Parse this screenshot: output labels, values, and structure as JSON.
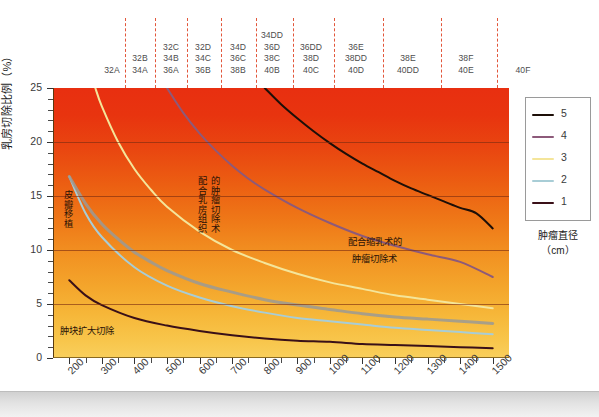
{
  "chart_data": {
    "type": "line",
    "title": "",
    "xlabel": "乳房体积(cm3)",
    "ylabel": "乳房切除比例(%)",
    "xlim": [
      150,
      1550
    ],
    "ylim": [
      0,
      25
    ],
    "xticks": [
      200,
      300,
      400,
      500,
      600,
      700,
      800,
      900,
      1000,
      1100,
      1200,
      1300,
      1400,
      1500
    ],
    "yticks": [
      0,
      5,
      10,
      15,
      20,
      25
    ],
    "grid": true,
    "legend_position": "right",
    "series": [
      {
        "name": "5",
        "label": "5",
        "color": "#1d0f08",
        "x": [
          800,
          850,
          900,
          950,
          1000,
          1050,
          1100,
          1150,
          1200,
          1250,
          1300,
          1350,
          1400,
          1450,
          1500
        ],
        "y": [
          25.0,
          23.5,
          22.2,
          21.0,
          19.9,
          18.9,
          18.0,
          17.2,
          16.4,
          15.7,
          15.1,
          14.5,
          13.9,
          13.4,
          12.0
        ]
      },
      {
        "name": "4",
        "label": "4",
        "color": "#8d5a7a",
        "x": [
          500,
          550,
          600,
          650,
          700,
          750,
          800,
          900,
          1000,
          1100,
          1200,
          1300,
          1400,
          1500
        ],
        "y": [
          25.0,
          22.7,
          20.8,
          19.2,
          17.8,
          16.6,
          15.6,
          13.9,
          12.5,
          11.3,
          10.4,
          9.6,
          8.9,
          7.5
        ]
      },
      {
        "name": "3",
        "label": "3",
        "color": "#f4e59a",
        "x": [
          280,
          300,
          350,
          400,
          450,
          500,
          600,
          700,
          800,
          900,
          1000,
          1100,
          1200,
          1300,
          1400,
          1500
        ],
        "y": [
          25.0,
          23.3,
          20.0,
          17.5,
          15.6,
          14.0,
          11.7,
          10.0,
          8.8,
          7.8,
          7.0,
          6.4,
          5.8,
          5.4,
          5.0,
          4.6
        ]
      },
      {
        "name": "2",
        "label": "2",
        "color": "#a8cdd6",
        "x": [
          200,
          250,
          300,
          400,
          500,
          600,
          700,
          800,
          900,
          1000,
          1100,
          1200,
          1300,
          1400,
          1500
        ],
        "y": [
          16.8,
          13.4,
          11.2,
          8.4,
          6.7,
          5.6,
          4.8,
          4.2,
          3.7,
          3.4,
          3.1,
          2.8,
          2.6,
          2.4,
          2.2
        ]
      },
      {
        "name": "1",
        "label": "1",
        "color": "#3a1018",
        "x": [
          200,
          250,
          300,
          400,
          500,
          600,
          700,
          800,
          900,
          1000,
          1100,
          1200,
          1300,
          1400,
          1500
        ],
        "y": [
          7.2,
          5.8,
          4.9,
          3.7,
          3.0,
          2.5,
          2.1,
          1.8,
          1.6,
          1.5,
          1.3,
          1.2,
          1.1,
          1.0,
          0.9
        ]
      },
      {
        "name": "皮瓣移植边界",
        "label": "皮瓣移植",
        "color": "#9a9a95",
        "x": [
          200,
          250,
          300,
          350,
          400,
          450,
          500,
          600,
          700,
          800,
          900,
          1000,
          1100,
          1200,
          1300,
          1400,
          1500
        ],
        "y": [
          16.8,
          14.3,
          12.4,
          11.0,
          9.8,
          8.9,
          8.1,
          6.9,
          6.1,
          5.4,
          4.9,
          4.5,
          4.1,
          3.8,
          3.6,
          3.4,
          3.2
        ]
      }
    ],
    "annotations": [
      {
        "text": "皮瓣移植",
        "x": 260,
        "y": 14.5,
        "orientation": "vertical"
      },
      {
        "text": "肿块扩大切除",
        "x": 250,
        "y": 2.6,
        "orientation": "horizontal"
      },
      {
        "text": "配合乳房组织",
        "x": 610,
        "y": 13.0,
        "orientation": "vertical"
      },
      {
        "text": "的肿瘤切除术",
        "x": 645,
        "y": 13.0,
        "orientation": "vertical"
      },
      {
        "text": "配合缩乳术的",
        "x": 1020,
        "y": 11.3,
        "orientation": "horizontal"
      },
      {
        "text": "肿瘤切除术",
        "x": 1020,
        "y": 9.6,
        "orientation": "horizontal"
      }
    ]
  },
  "axes": {
    "y_title": "乳房切除比例（%）",
    "y_labels": [
      "25",
      "20",
      "15",
      "10",
      "5",
      "0"
    ],
    "x_title_pre": "乳房体积（cm",
    "x_title_sup": "3",
    "x_title_post": "）",
    "x_labels": [
      "200",
      "300",
      "400",
      "500",
      "600",
      "700",
      "800",
      "900",
      "1000",
      "1100",
      "1200",
      "1300",
      "1400",
      "1500"
    ]
  },
  "top_band": {
    "groups": [
      {
        "lines": [
          "32A"
        ],
        "x": 59
      },
      {
        "lines": [
          "32B",
          "34A"
        ],
        "x": 87
      },
      {
        "lines": [
          "32C",
          "34B",
          "36A"
        ],
        "x": 118
      },
      {
        "lines": [
          "32D",
          "34C",
          "36B"
        ],
        "x": 150
      },
      {
        "lines": [
          "34D",
          "36C",
          "38B"
        ],
        "x": 185
      },
      {
        "lines": [
          "34DD",
          "36D",
          "38C",
          "40B"
        ],
        "x": 219
      },
      {
        "lines": [
          "36DD",
          "38D",
          "40C"
        ],
        "x": 258
      },
      {
        "lines": [
          "36E",
          "38DD",
          "40D"
        ],
        "x": 303
      },
      {
        "lines": [
          "38E",
          "40DD"
        ],
        "x": 355
      },
      {
        "lines": [
          "38F",
          "40E"
        ],
        "x": 413
      },
      {
        "lines": [
          "40F"
        ],
        "x": 470
      }
    ],
    "dash_x": [
      72,
      102,
      134,
      168,
      203,
      240,
      281,
      330,
      388,
      444
    ]
  },
  "legend": {
    "entries": [
      {
        "label": "5",
        "color": "#1d0f08"
      },
      {
        "label": "4",
        "color": "#8d5a7a"
      },
      {
        "label": "3",
        "color": "#f4e59a"
      },
      {
        "label": "2",
        "color": "#a8cdd6"
      },
      {
        "label": "1",
        "color": "#3a1018"
      }
    ],
    "title_line1": "肿瘤直径",
    "title_line2": "（cm）"
  },
  "annotations_text": {
    "flap": "皮瓣移植",
    "lumpectomy": "肿块扩大切除",
    "breast_tissue_1": "配合乳房组织",
    "breast_tissue_2": "的肿瘤切除术",
    "reduction_1": "配合缩乳术的",
    "reduction_2": "肿瘤切除术"
  }
}
